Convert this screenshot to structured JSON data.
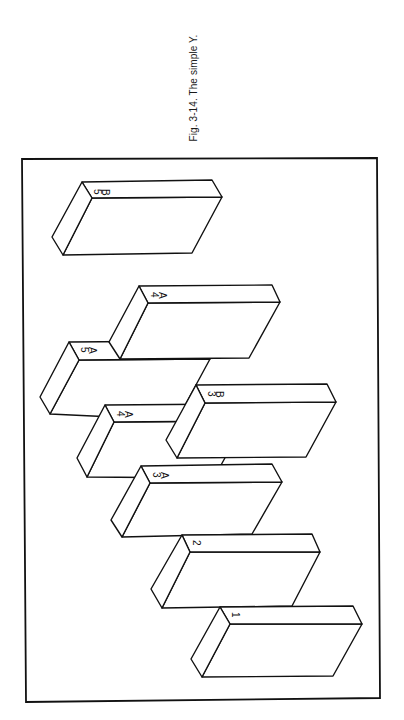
{
  "caption": "Fig. 3-14. The simple Y.",
  "colors": {
    "ink": "#111111",
    "paper": "#ffffff"
  },
  "frame": {
    "points": [
      [
        22,
        159
      ],
      [
        377,
        158
      ],
      [
        380,
        698
      ],
      [
        26,
        702
      ]
    ]
  },
  "blocks": [
    {
      "id": "5B",
      "labels": [
        "5",
        "B"
      ]
    },
    {
      "id": "4A-upper",
      "labels": [
        "4",
        "A"
      ]
    },
    {
      "id": "5A",
      "labels": [
        "5",
        "A"
      ]
    },
    {
      "id": "3B",
      "labels": [
        "3",
        "B"
      ]
    },
    {
      "id": "4A-lower",
      "labels": [
        "4",
        "A"
      ]
    },
    {
      "id": "3A",
      "labels": [
        "3",
        "A"
      ]
    },
    {
      "id": "2",
      "labels": [
        "2"
      ]
    },
    {
      "id": "1",
      "labels": [
        "1"
      ]
    }
  ]
}
